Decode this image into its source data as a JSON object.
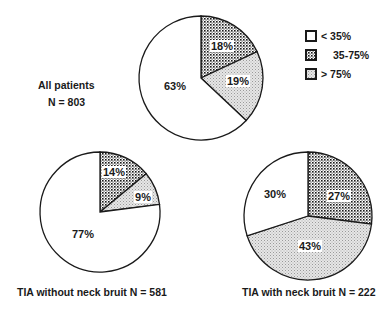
{
  "chart_data": [
    {
      "type": "pie",
      "title": "All patients",
      "subtitle": "N = 803",
      "labels": [
        "< 35%",
        "35-75%",
        "> 75%"
      ],
      "values": [
        63,
        18,
        19
      ],
      "value_labels": [
        "63%",
        "18%",
        "19%"
      ]
    },
    {
      "type": "pie",
      "title": "TIA without neck bruit N = 581",
      "labels": [
        "< 35%",
        "35-75%",
        "> 75%"
      ],
      "values": [
        77,
        14,
        9
      ],
      "value_labels": [
        "77%",
        "14%",
        "9%"
      ]
    },
    {
      "type": "pie",
      "title": "TIA with neck bruit N = 222",
      "labels": [
        "< 35%",
        "35-75%",
        "> 75%"
      ],
      "values": [
        30,
        27,
        43
      ],
      "value_labels": [
        "30%",
        "27%",
        "43%"
      ]
    }
  ],
  "legend": {
    "position": "top-right",
    "items": [
      {
        "label": "< 35%",
        "pattern": "white"
      },
      {
        "label": "35-75%",
        "pattern": "dense-dots"
      },
      {
        "label": "> 75%",
        "pattern": "light-stipple"
      }
    ]
  },
  "labels": {
    "all_title": "All patients",
    "all_n": "N = 803",
    "without_title": "TIA without neck bruit N = 581",
    "with_title": "TIA with neck bruit N = 222"
  },
  "colors": {
    "stroke": "#1a1a1a",
    "low": "#ffffff",
    "mid": "#9a9a9a",
    "high": "#d8d8d8"
  }
}
